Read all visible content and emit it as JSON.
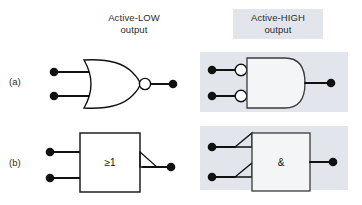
{
  "figure": {
    "title_low": "Active-LOW\noutput",
    "title_high": "Active-HIGH\noutput",
    "highlight_color": "#e2e6ec",
    "line_color": "#111111",
    "rows": [
      {
        "label": "(a)",
        "left": {
          "symbol_style": "distinctive-shape",
          "gate": "NOR",
          "inner_label": "",
          "inputs": 2,
          "input_bubbles": false,
          "output_bubble": true,
          "highlighted": false
        },
        "right": {
          "symbol_style": "distinctive-shape",
          "gate": "AND-with-inverted-inputs",
          "inner_label": "",
          "inputs": 2,
          "input_bubbles": true,
          "output_bubble": false,
          "highlighted": true
        }
      },
      {
        "label": "(b)",
        "left": {
          "symbol_style": "iec-rectangular",
          "gate": "OR",
          "inner_label": "≥1",
          "inputs": 2,
          "input_polarity_triangles": false,
          "output_polarity_triangle": true,
          "highlighted": false
        },
        "right": {
          "symbol_style": "iec-rectangular",
          "gate": "AND",
          "inner_label": "&",
          "inputs": 2,
          "input_polarity_triangles": true,
          "output_polarity_triangle": false,
          "highlighted": true
        }
      }
    ]
  }
}
